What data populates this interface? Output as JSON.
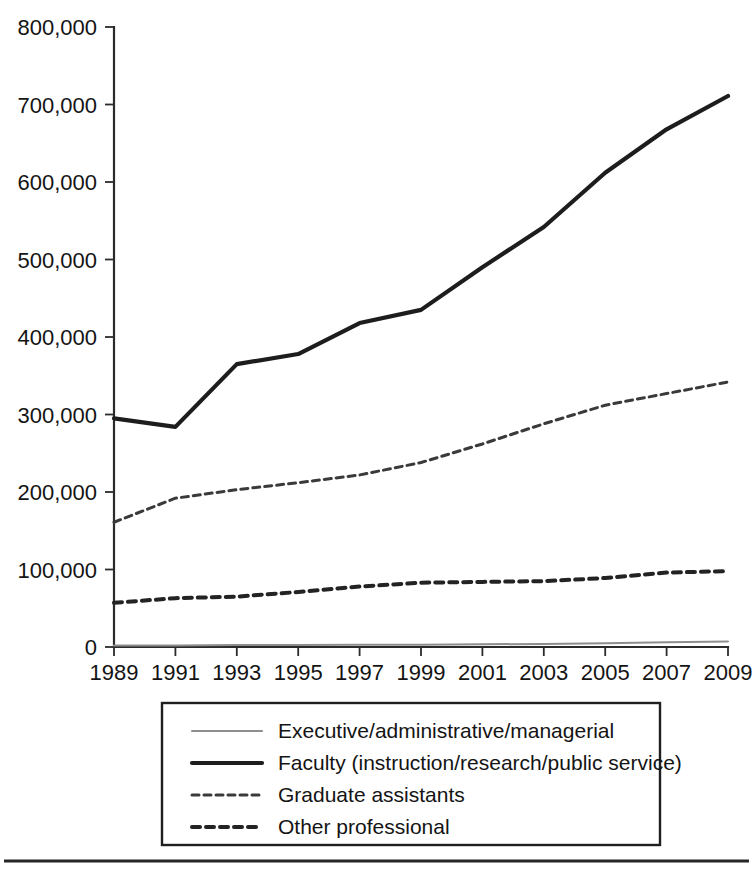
{
  "chart_data": {
    "type": "line",
    "title": "",
    "subtitle": "",
    "xlabel": "",
    "ylabel": "",
    "x": [
      1989,
      1991,
      1993,
      1995,
      1997,
      1999,
      2001,
      2003,
      2005,
      2007,
      2009
    ],
    "xtick_labels": [
      "1989",
      "1991",
      "1993",
      "1995",
      "1997",
      "1999",
      "2001",
      "2003",
      "2005",
      "2007",
      "2009"
    ],
    "ytick_labels": [
      "0",
      "100,000",
      "200,000",
      "300,000",
      "400,000",
      "500,000",
      "600,000",
      "700,000",
      "800,000"
    ],
    "ytick_values": [
      0,
      100000,
      200000,
      300000,
      400000,
      500000,
      600000,
      700000,
      800000
    ],
    "xlim": [
      1989,
      2009
    ],
    "ylim": [
      0,
      800000
    ],
    "grid": false,
    "legend_position": "below-plot",
    "series": [
      {
        "name": "Executive/administrative/managerial",
        "style": "solid-thin-gray",
        "color": "#8e8e8e",
        "values": [
          2000,
          2000,
          2500,
          2500,
          3000,
          3000,
          3500,
          4000,
          5000,
          6000,
          7000
        ]
      },
      {
        "name": "Faculty (instruction/research/public service)",
        "style": "solid-thick-black",
        "color": "#1d1d1d",
        "values": [
          295000,
          284000,
          365000,
          378000,
          418000,
          435000,
          490000,
          542000,
          612000,
          668000,
          711000
        ]
      },
      {
        "name": "Graduate assistants",
        "style": "fine-dashed",
        "color": "#3a3a3a",
        "values": [
          161000,
          192000,
          203000,
          212000,
          222000,
          238000,
          262000,
          288000,
          312000,
          327000,
          342000
        ]
      },
      {
        "name": "Other professional",
        "style": "bold-dashed",
        "color": "#232323",
        "values": [
          57000,
          63000,
          65000,
          71000,
          78000,
          83000,
          84000,
          85000,
          89000,
          96000,
          98000
        ]
      }
    ]
  },
  "legend": {
    "entries": [
      {
        "label": "Executive/administrative/managerial",
        "swatch": "solid-thin-gray"
      },
      {
        "label": "Faculty (instruction/research/public service)",
        "swatch": "solid-thick-black"
      },
      {
        "label": "Graduate assistants",
        "swatch": "fine-dashed"
      },
      {
        "label": "Other professional",
        "swatch": "bold-dashed"
      }
    ]
  },
  "colors": {
    "axis": "#2b2b2b",
    "text": "#141414",
    "background": "#ffffff",
    "executive": "#8e8e8e",
    "faculty": "#1d1d1d",
    "graduate": "#3a3a3a",
    "other_professional": "#232323"
  }
}
